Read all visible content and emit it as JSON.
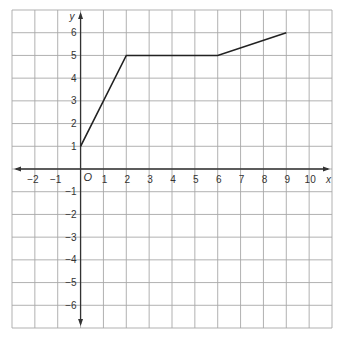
{
  "chart_data": {
    "type": "line",
    "title": "",
    "xlabel": "x",
    "ylabel": "y",
    "origin_label": "O",
    "xlim": [
      -3,
      11
    ],
    "ylim": [
      -7,
      7
    ],
    "grid": true,
    "x_ticks": [
      -2,
      -1,
      1,
      2,
      3,
      4,
      5,
      6,
      7,
      8,
      9,
      10
    ],
    "y_ticks": [
      6,
      5,
      4,
      3,
      2,
      1,
      -1,
      -2,
      -3,
      -4,
      -5,
      -6
    ],
    "series": [
      {
        "name": "graph",
        "points": [
          [
            0,
            1
          ],
          [
            2,
            5
          ],
          [
            6,
            5
          ],
          [
            9,
            6
          ]
        ]
      }
    ],
    "colors": {
      "grid": "#a8a8a8",
      "axis": "#333333",
      "line": "#222222",
      "text": "#333333"
    }
  }
}
